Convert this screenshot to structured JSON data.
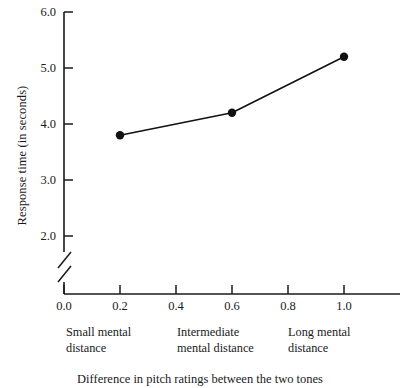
{
  "chart_data": {
    "type": "line",
    "title": "",
    "caption": "Difference in pitch ratings between the two tones",
    "xlabel": "",
    "ylabel": "Response time  (in seconds)",
    "x": [
      0.2,
      0.6,
      1.0
    ],
    "values": [
      3.8,
      4.2,
      5.2
    ],
    "series": [
      {
        "name": "Response time",
        "x": [
          0.2,
          0.6,
          1.0
        ],
        "values": [
          3.8,
          4.2,
          5.2
        ]
      }
    ],
    "xlim": [
      0.0,
      1.2
    ],
    "ylim": [
      2.0,
      6.0
    ],
    "xticks": [
      0.0,
      0.2,
      0.4,
      0.6,
      0.8,
      1.0
    ],
    "xtick_labels": [
      "0.0",
      "0.2",
      "0.4",
      "0.6",
      "0.8",
      "1.0"
    ],
    "yticks": [
      2.0,
      3.0,
      4.0,
      5.0,
      6.0
    ],
    "ytick_labels": [
      "2.0",
      "3.0",
      "4.0",
      "5.0",
      "6.0"
    ],
    "y_axis_break": true,
    "grid": false,
    "legend": "none",
    "marker": "filled-circle",
    "line_color": "#111111",
    "marker_color": "#111111",
    "axis_color": "#1a1a1a",
    "background": "#ffffff",
    "category_labels": [
      {
        "at_x": 0.2,
        "line1": "Small mental",
        "line2": "distance"
      },
      {
        "at_x": 0.6,
        "line1": "Intermediate",
        "line2": "mental distance"
      },
      {
        "at_x": 1.0,
        "line1": "Long mental",
        "line2": "distance"
      }
    ]
  }
}
